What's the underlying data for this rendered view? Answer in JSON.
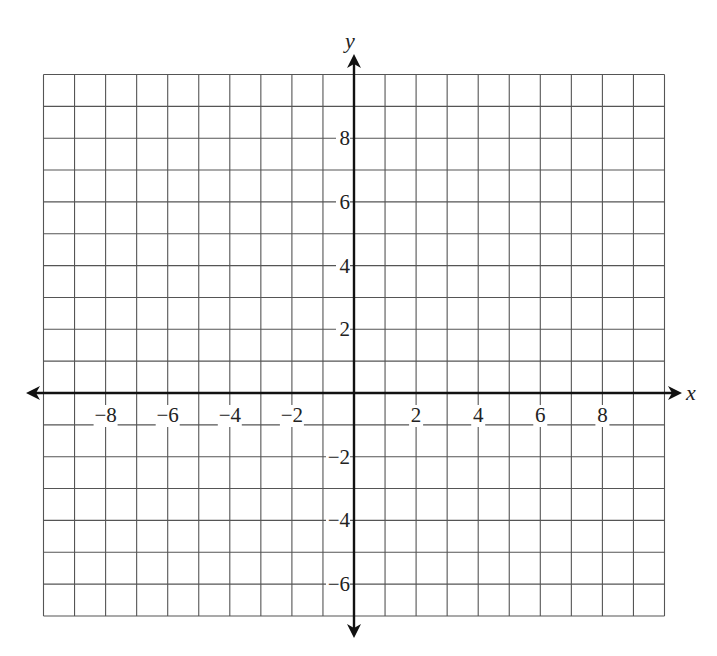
{
  "graph": {
    "x_axis_label": "x",
    "y_axis_label": "y",
    "x_range": [
      -10,
      10
    ],
    "y_range": [
      -7,
      10
    ],
    "grid_step": 1,
    "x_tick_labels": [
      {
        "value": -8,
        "text": "−8"
      },
      {
        "value": -6,
        "text": "−6"
      },
      {
        "value": -4,
        "text": "−4"
      },
      {
        "value": -2,
        "text": "−2"
      },
      {
        "value": 2,
        "text": "2"
      },
      {
        "value": 4,
        "text": "4"
      },
      {
        "value": 6,
        "text": "6"
      },
      {
        "value": 8,
        "text": "8"
      }
    ],
    "y_tick_labels": [
      {
        "value": 8,
        "text": "8"
      },
      {
        "value": 6,
        "text": "6"
      },
      {
        "value": 4,
        "text": "4"
      },
      {
        "value": 2,
        "text": "2"
      },
      {
        "value": -2,
        "text": "−2"
      },
      {
        "value": -4,
        "text": "−4"
      },
      {
        "value": -6,
        "text": "−6"
      }
    ],
    "colors": {
      "grid": "#555555",
      "axis": "#111111",
      "text": "#222222",
      "background": "#ffffff"
    }
  }
}
